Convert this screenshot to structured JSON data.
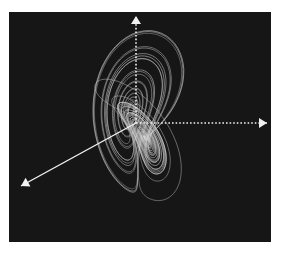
{
  "figure": {
    "background_color": "#161616",
    "page_color": "#ffffff",
    "trajectory_color": "#d8d8d8",
    "axis_color": "#f2f2f2"
  },
  "attractor": {
    "sigma": 10,
    "rho": 28,
    "beta": 2.6667,
    "steps": 9000,
    "dt": 0.006,
    "start": [
      1,
      1,
      1
    ]
  },
  "axes": {
    "origin": [
      127,
      111
    ],
    "vertical": {
      "style": "dotted",
      "tip": [
        127,
        4
      ]
    },
    "horizontal": {
      "style": "dotted",
      "tip": [
        258,
        111
      ]
    },
    "diagonal": {
      "style": "solid",
      "tip": [
        12,
        174
      ]
    }
  }
}
